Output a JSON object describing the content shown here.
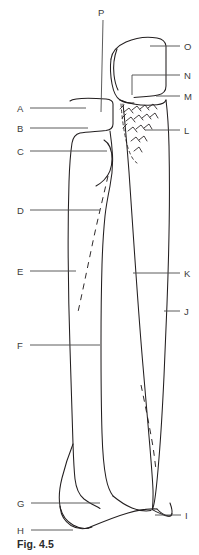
{
  "figure": {
    "caption": "Fig. 4.5",
    "background_color": "#ffffff",
    "line_color": "#231f20",
    "leader_color": "#4a4a4a",
    "label_color": "#3b3b3b"
  },
  "labels": {
    "left": [
      {
        "id": "A",
        "text": "A",
        "x": 17,
        "y": 104,
        "leader_from_x": 30,
        "leader_to_x": 86,
        "leader_y": 108
      },
      {
        "id": "B",
        "text": "B",
        "x": 17,
        "y": 124,
        "leader_from_x": 30,
        "leader_to_x": 88,
        "leader_y": 128
      },
      {
        "id": "C",
        "text": "C",
        "x": 17,
        "y": 147,
        "leader_from_x": 30,
        "leader_to_x": 107,
        "leader_y": 151
      },
      {
        "id": "D",
        "text": "D",
        "x": 17,
        "y": 206,
        "leader_from_x": 30,
        "leader_to_x": 100,
        "leader_y": 210
      },
      {
        "id": "E",
        "text": "E",
        "x": 17,
        "y": 267,
        "leader_from_x": 30,
        "leader_to_x": 76,
        "leader_y": 271
      },
      {
        "id": "F",
        "text": "F",
        "x": 17,
        "y": 341,
        "leader_from_x": 30,
        "leader_to_x": 100,
        "leader_y": 345
      },
      {
        "id": "G",
        "text": "G",
        "x": 17,
        "y": 499,
        "leader_from_x": 31,
        "leader_to_x": 100,
        "leader_y": 503
      },
      {
        "id": "H",
        "text": "H",
        "x": 17,
        "y": 526,
        "leader_from_x": 31,
        "leader_to_x": 73,
        "leader_y": 530
      }
    ],
    "right": [
      {
        "id": "O",
        "text": "O",
        "x": 184,
        "y": 42,
        "leader_from_x": 180,
        "leader_to_x": 150,
        "leader_y": 46
      },
      {
        "id": "N",
        "text": "N",
        "x": 184,
        "y": 71,
        "leader_from_x": 180,
        "leader_to_x": 132,
        "leader_y": 75
      },
      {
        "id": "M",
        "text": "M",
        "x": 184,
        "y": 92,
        "leader_from_x": 180,
        "leader_to_x": 156,
        "leader_y": 96
      },
      {
        "id": "L",
        "text": "L",
        "x": 184,
        "y": 126,
        "leader_from_x": 180,
        "leader_to_x": 145,
        "leader_y": 130
      },
      {
        "id": "K",
        "text": "K",
        "x": 184,
        "y": 269,
        "leader_from_x": 180,
        "leader_to_x": 133,
        "leader_y": 273
      },
      {
        "id": "J",
        "text": "J",
        "x": 184,
        "y": 307,
        "leader_from_x": 180,
        "leader_to_x": 164,
        "leader_y": 311
      },
      {
        "id": "I",
        "text": "I",
        "x": 185,
        "y": 511,
        "leader_from_x": 181,
        "leader_to_x": 155,
        "leader_y": 515
      }
    ],
    "top": [
      {
        "id": "P",
        "text": "P",
        "x": 98,
        "y": 8,
        "leader_from_y": 20,
        "leader_to_y": 112,
        "leader_x": 103
      }
    ],
    "edge_fragments": [
      {
        "id": "left-top-fragment",
        "text": "",
        "x": 0,
        "y": 10
      },
      {
        "id": "left-mid-fragment",
        "text": "",
        "x": 0,
        "y": 315
      }
    ]
  },
  "legend": {
    "note": "Leader lines connect letters to anatomical features of the radius (left bone) and ulna (right bone)."
  }
}
